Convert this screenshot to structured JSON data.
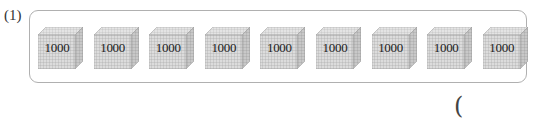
{
  "question": {
    "label": "(1)",
    "cubes": [
      {
        "value": "1000"
      },
      {
        "value": "1000"
      },
      {
        "value": "1000"
      },
      {
        "value": "1000"
      },
      {
        "value": "1000"
      },
      {
        "value": "1000"
      },
      {
        "value": "1000"
      },
      {
        "value": "1000"
      },
      {
        "value": "1000"
      }
    ],
    "answer_open_paren": "("
  },
  "colors": {
    "frame_border": "#b0b0b0",
    "cube_face": "#d9d9d9",
    "cube_grid": "#9a9a9a"
  }
}
